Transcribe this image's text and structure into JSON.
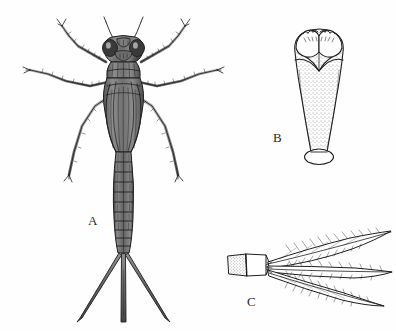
{
  "plate": {
    "title": "Damselfly naiad (Zygoptera nymph) morphology plate",
    "background_color": "#fefefe",
    "ink_color": "#1f1f1f",
    "shade_color": "#6e6e6e",
    "width": 396,
    "height": 331,
    "medium": "stippled pen-and-ink scientific illustration"
  },
  "figures": [
    {
      "key": "A",
      "label": "A",
      "label_x": 88,
      "label_y": 213,
      "caption": "Dorsal habitus of damselfly naiad",
      "subject": "whole nymph, dorsal view",
      "parts": [
        "antennae",
        "compound eyes",
        "head",
        "prothorax",
        "wing pads",
        "three pairs of legs",
        "ten-segmented abdomen",
        "three caudal lamellae"
      ],
      "abdominal_segments": 10,
      "caudal_lamellae_count": 3,
      "leg_pairs": 3
    },
    {
      "key": "B",
      "label": "B",
      "label_x": 273,
      "label_y": 130,
      "caption": "Labium (prementum), ventral view",
      "subject": "prementum with labial palps",
      "parts": [
        "labial palps",
        "movable hooks",
        "end hooks",
        "prementum",
        "basal hinge"
      ],
      "shading": "stippled"
    },
    {
      "key": "C",
      "label": "C",
      "label_x": 247,
      "label_y": 294,
      "caption": "Caudal lamellae (gills), lateral view",
      "subject": "terminal abdominal segments with three caudal gills",
      "parts": [
        "terminal abdominal segments",
        "median caudal lamella",
        "lateral caudal lamellae",
        "tracheal branches",
        "marginal setae"
      ],
      "lamellae_count": 3
    }
  ]
}
